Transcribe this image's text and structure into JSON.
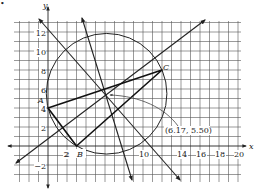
{
  "figure": {
    "marker": "•",
    "axes": {
      "x_label": "x",
      "y_label": "y",
      "x_ticks": [
        {
          "value": 2,
          "label": "2"
        },
        {
          "value": 10,
          "label": "10"
        },
        {
          "value": 14,
          "label": "14"
        },
        {
          "value": 16,
          "label": "16"
        },
        {
          "value": 18,
          "label": "18"
        },
        {
          "value": 20,
          "label": "20"
        }
      ],
      "y_ticks": [
        {
          "value": 12,
          "label": "12"
        },
        {
          "value": 10,
          "label": "10"
        },
        {
          "value": 8,
          "label": "8"
        },
        {
          "value": 6,
          "label": "6"
        },
        {
          "value": 4,
          "label": "4"
        },
        {
          "value": 2,
          "label": "2"
        },
        {
          "value": -2,
          "label": "−2"
        }
      ],
      "x_range": [
        -3.5,
        20.5
      ],
      "y_range": [
        -3.5,
        13.5
      ],
      "grid": true
    },
    "points": {
      "A": {
        "label": "A",
        "x": 0,
        "y": 4
      },
      "B": {
        "label": "B",
        "x": 3,
        "y": 0
      },
      "C": {
        "label": "C",
        "x": 12,
        "y": 8
      }
    },
    "circumcenter": {
      "x": 6.17,
      "y": 5.5,
      "label": "(6.17, 5.50)"
    },
    "circle_radius": 6.35,
    "bisectors": [
      {
        "name": "perpendicular bisector of AB"
      },
      {
        "name": "perpendicular bisector of AC"
      },
      {
        "name": "perpendicular bisector of BC"
      }
    ]
  }
}
